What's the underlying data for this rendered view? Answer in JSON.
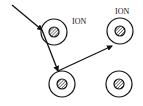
{
  "diagram": {
    "type": "scattering-path",
    "colors": {
      "stroke": "#111111",
      "background": "#ffffff"
    },
    "ions": [
      {
        "id": "ion-1",
        "cx": 54,
        "cy": 32,
        "label": "ION",
        "label_x": 72,
        "label_y": 24
      },
      {
        "id": "ion-2",
        "cx": 120,
        "cy": 31,
        "label": "ION",
        "label_x": 115,
        "label_y": 14
      },
      {
        "id": "ion-3",
        "cx": 62,
        "cy": 84,
        "label": ""
      },
      {
        "id": "ion-4",
        "cx": 119,
        "cy": 84,
        "label": ""
      }
    ],
    "path": [
      {
        "from": [
          12,
          5
        ],
        "to": [
          42,
          30
        ]
      },
      {
        "from": [
          42,
          30
        ],
        "to": [
          58,
          71
        ]
      },
      {
        "from": [
          58,
          71
        ],
        "to": [
          112,
          46
        ]
      }
    ]
  }
}
